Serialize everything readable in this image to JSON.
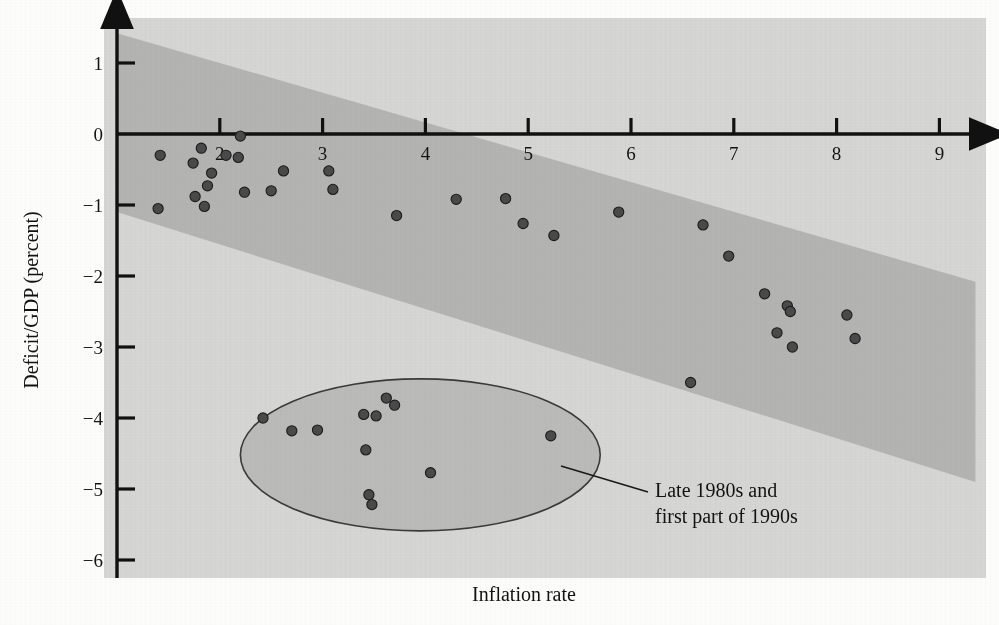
{
  "chart_data": {
    "type": "scatter",
    "title": "",
    "xlabel": "Inflation rate",
    "ylabel": "Deficit/GDP (percent)",
    "xlim": [
      1,
      9.3
    ],
    "ylim": [
      -6,
      1.45
    ],
    "xticks": [
      2,
      3,
      4,
      5,
      6,
      7,
      8,
      9
    ],
    "xtick_labels": [
      "2",
      "3",
      "4",
      "5",
      "6",
      "7",
      "8",
      "9"
    ],
    "yticks": [
      1,
      0,
      -1,
      -2,
      -3,
      -4,
      -5,
      -6
    ],
    "ytick_labels": [
      "1",
      "0",
      "−1",
      "−2",
      "−3",
      "−4",
      "−5",
      "−6"
    ],
    "grid": false,
    "legend": "none",
    "marker_color": "#4a4a4a",
    "band_color": "#b5b5b5",
    "background_color": "#d6d6d4",
    "points": [
      {
        "x": 1.42,
        "y": -0.3
      },
      {
        "x": 1.82,
        "y": -0.2
      },
      {
        "x": 1.74,
        "y": -0.41
      },
      {
        "x": 1.92,
        "y": -0.55
      },
      {
        "x": 1.88,
        "y": -0.73
      },
      {
        "x": 1.76,
        "y": -0.88
      },
      {
        "x": 2.06,
        "y": -0.3
      },
      {
        "x": 2.2,
        "y": -0.03
      },
      {
        "x": 2.18,
        "y": -0.33
      },
      {
        "x": 1.4,
        "y": -1.05
      },
      {
        "x": 1.85,
        "y": -1.02
      },
      {
        "x": 2.24,
        "y": -0.82
      },
      {
        "x": 2.5,
        "y": -0.8
      },
      {
        "x": 2.62,
        "y": -0.52
      },
      {
        "x": 3.06,
        "y": -0.52
      },
      {
        "x": 3.1,
        "y": -0.78
      },
      {
        "x": 3.72,
        "y": -1.15
      },
      {
        "x": 4.3,
        "y": -0.92
      },
      {
        "x": 4.78,
        "y": -0.91
      },
      {
        "x": 4.95,
        "y": -1.26
      },
      {
        "x": 5.25,
        "y": -1.43
      },
      {
        "x": 5.88,
        "y": -1.1
      },
      {
        "x": 6.7,
        "y": -1.28
      },
      {
        "x": 6.95,
        "y": -1.72
      },
      {
        "x": 7.3,
        "y": -2.25
      },
      {
        "x": 7.52,
        "y": -2.42
      },
      {
        "x": 7.55,
        "y": -2.5
      },
      {
        "x": 7.42,
        "y": -2.8
      },
      {
        "x": 7.57,
        "y": -3.0
      },
      {
        "x": 8.1,
        "y": -2.55
      },
      {
        "x": 8.18,
        "y": -2.88
      },
      {
        "x": 6.58,
        "y": -3.5
      }
    ],
    "highlight_points": [
      {
        "x": 2.42,
        "y": -4.0
      },
      {
        "x": 2.7,
        "y": -4.18
      },
      {
        "x": 2.95,
        "y": -4.17
      },
      {
        "x": 3.4,
        "y": -3.95
      },
      {
        "x": 3.52,
        "y": -3.97
      },
      {
        "x": 3.62,
        "y": -3.72
      },
      {
        "x": 3.7,
        "y": -3.82
      },
      {
        "x": 3.42,
        "y": -4.45
      },
      {
        "x": 3.45,
        "y": -5.08
      },
      {
        "x": 3.48,
        "y": -5.22
      },
      {
        "x": 4.05,
        "y": -4.77
      },
      {
        "x": 5.22,
        "y": -4.25
      }
    ],
    "band": {
      "label": "trend band",
      "left_x": 1.0,
      "right_x": 9.35,
      "top_left_y": 1.42,
      "top_right_y": -2.08,
      "bottom_left_y": -1.1,
      "bottom_right_y": -4.9
    },
    "annotation": {
      "ellipse_label": "Late 1980s and first part of 1990s",
      "line1": "Late 1980s and",
      "line2": "first part of 1990s",
      "ellipse_center": [
        3.95,
        -4.52
      ],
      "ellipse_rx": 1.75,
      "ellipse_ry": 1.07
    }
  }
}
